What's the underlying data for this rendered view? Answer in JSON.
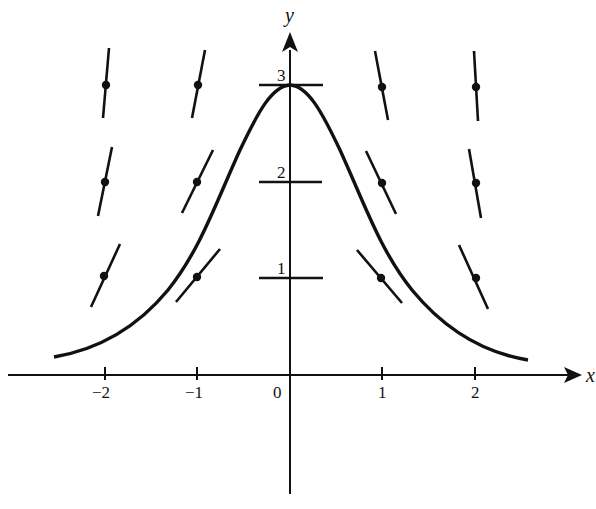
{
  "diagram": {
    "type": "slope-field",
    "axes": {
      "x_label": "x",
      "y_label": "y",
      "x_ticks": [
        {
          "value": -2,
          "label": "−2"
        },
        {
          "value": -1,
          "label": "−1"
        },
        {
          "value": 0,
          "label": "0"
        },
        {
          "value": 1,
          "label": "1"
        },
        {
          "value": 2,
          "label": "2"
        }
      ],
      "y_ticks": [
        {
          "value": 1,
          "label": "1"
        },
        {
          "value": 2,
          "label": "2"
        },
        {
          "value": 3,
          "label": "3"
        }
      ]
    },
    "slope_points": [
      {
        "x": -2,
        "y": 3
      },
      {
        "x": -1,
        "y": 3
      },
      {
        "x": 1,
        "y": 3
      },
      {
        "x": 2,
        "y": 3
      },
      {
        "x": -2,
        "y": 2
      },
      {
        "x": -1,
        "y": 2
      },
      {
        "x": 1,
        "y": 2
      },
      {
        "x": 2,
        "y": 2
      },
      {
        "x": -2,
        "y": 1
      },
      {
        "x": -1,
        "y": 1
      },
      {
        "x": 1,
        "y": 1
      },
      {
        "x": 2,
        "y": 1
      }
    ],
    "solution_curve": {
      "shape": "bell",
      "peak": {
        "x": 0,
        "y": 3
      },
      "x_range": [
        -2.55,
        2.55
      ]
    },
    "colors": {
      "ink": "#111111",
      "background": "#ffffff"
    }
  }
}
